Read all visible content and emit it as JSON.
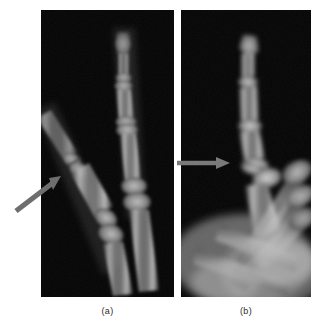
{
  "figure": {
    "background_color": "#ffffff",
    "panel_count": 2,
    "panels": [
      {
        "id": "a",
        "caption": "(a)",
        "view": "anteroposterior-finger-radiograph",
        "background_color": "#000000",
        "x": 41,
        "y": 10,
        "width": 133,
        "height": 287,
        "annotation": {
          "type": "arrow",
          "orientation": "diagonal-up-right",
          "color": "#6e6e6e",
          "tail": [
            16,
            211
          ],
          "tip": [
            60,
            177
          ]
        }
      },
      {
        "id": "b",
        "caption": "(b)",
        "view": "lateral-oblique-finger-radiograph",
        "background_color": "#000000",
        "x": 181,
        "y": 10,
        "width": 130,
        "height": 287,
        "annotation": {
          "type": "arrow",
          "orientation": "horizontal-right",
          "color": "#7a7a7a",
          "tail": [
            178,
            163
          ],
          "tip": [
            229,
            163
          ]
        }
      }
    ]
  },
  "captions": {
    "panel_a_label": "(a)",
    "panel_b_label": "(b)"
  },
  "colors": {
    "page_background": "#ffffff",
    "film_background": "#000000",
    "arrow_gray": "#6e6e6e",
    "bone_bright": "#d8d8d8",
    "bone_mid": "#8f8f8f",
    "bone_dim": "#4a4a4a",
    "caption_text": "#2b2b2b"
  }
}
